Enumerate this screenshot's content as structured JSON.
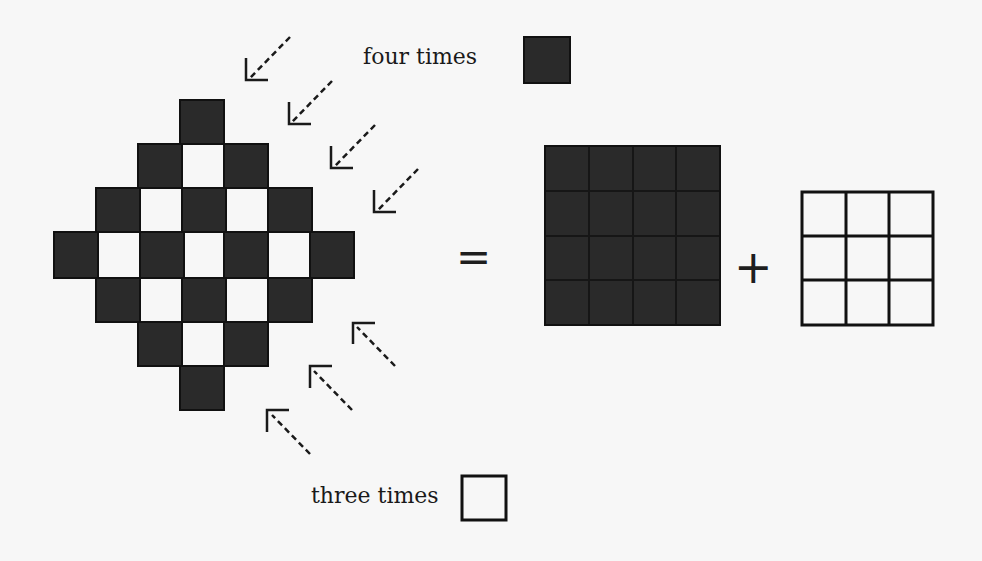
{
  "labels": {
    "four_times": "four times",
    "three_times": "three times"
  },
  "operators": {
    "equals": "=",
    "plus": "+"
  },
  "colors": {
    "dark_tile": "#2a2a2a",
    "light_tile": "#f7f7f7",
    "background": "#f7f7f7",
    "stroke": "#111111"
  },
  "diamond": {
    "description": "Diamond of tiles: dark tiles = (n+1)^2 with n=3, light tiles = n^2",
    "rows": [
      "---D---",
      "--DLD--",
      "-DLDLD-",
      "DLDLDLD",
      "-DLDLD-",
      "--DLD--",
      "---D---"
    ]
  },
  "dark_square": {
    "size": 4,
    "count": 16
  },
  "light_square": {
    "size": 3,
    "count": 9
  },
  "arrows": {
    "top_right_count": 4,
    "bottom_right_count": 3,
    "style": "dashed"
  }
}
